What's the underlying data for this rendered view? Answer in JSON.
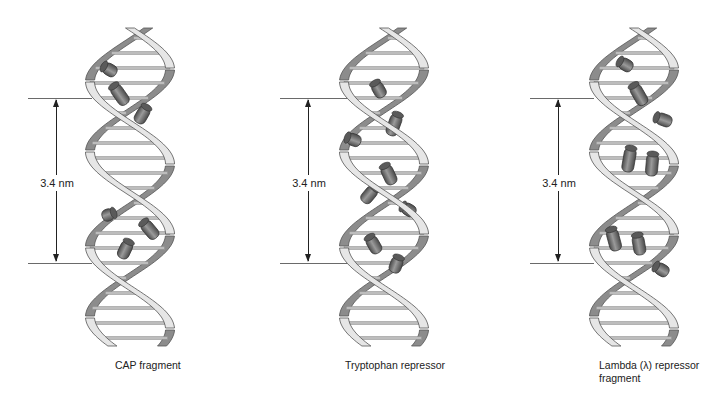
{
  "figure": {
    "panels": [
      {
        "id": "cap",
        "caption_lines": [
          "CAP fragment"
        ],
        "measurement_label": "3.4 nm",
        "ref_line_x": [
          28,
          92
        ],
        "arrow_x": 56,
        "helix_x": 88,
        "caption_pos": [
          115,
          359
        ]
      },
      {
        "id": "trp",
        "caption_lines": [
          "Tryptophan repressor"
        ],
        "measurement_label": "3.4 nm",
        "ref_line_x": [
          280,
          347
        ],
        "arrow_x": 308,
        "helix_x": 342,
        "caption_pos": [
          345,
          359
        ]
      },
      {
        "id": "lambda",
        "caption_lines": [
          "Lambda (λ) repressor",
          "fragment"
        ],
        "measurement_label": "3.4 nm",
        "ref_line_x": [
          530,
          594
        ],
        "arrow_x": 558,
        "helix_x": 592,
        "caption_pos": [
          599,
          359
        ]
      }
    ],
    "ref_line_y": [
      98,
      263
    ],
    "colors": {
      "ribbon_light": "#e6e6e6",
      "ribbon_dark": "#8c8c8c",
      "ribbon_edge": "#555555",
      "protein": "#6e6e6e",
      "protein_dark": "#4a4a4a",
      "base_pair": "#bdbdbd",
      "text": "#222222"
    }
  }
}
